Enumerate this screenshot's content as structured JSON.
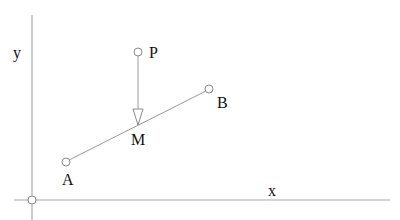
{
  "diagram": {
    "axes": {
      "x_label": "x",
      "y_label": "y"
    },
    "points": {
      "P": {
        "label": "P"
      },
      "A": {
        "label": "A"
      },
      "B": {
        "label": "B"
      },
      "M": {
        "label": "M"
      }
    }
  }
}
